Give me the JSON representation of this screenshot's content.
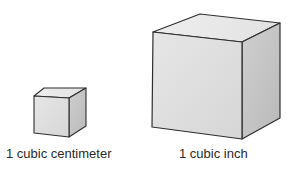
{
  "figure": {
    "cubes": [
      {
        "id": "cubic-centimeter",
        "label": "1 cubic centimeter",
        "colors": {
          "top": "#e8e8e8",
          "front": "#dedede",
          "side": "#c4c4c4",
          "edge": "#2e2e2e"
        }
      },
      {
        "id": "cubic-inch",
        "label": "1 cubic inch",
        "colors": {
          "top": "#e8e8e8",
          "front": "#dedede",
          "side": "#c4c4c4",
          "edge": "#2e2e2e"
        }
      }
    ]
  }
}
